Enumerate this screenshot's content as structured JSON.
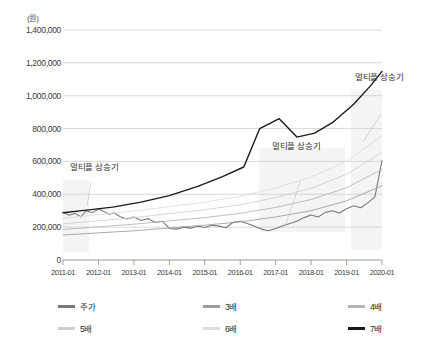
{
  "chart_data": {
    "type": "line",
    "title": "",
    "xlabel": "",
    "ylabel": "",
    "unit_label": "(원)",
    "ylim": [
      0,
      1400000
    ],
    "ytick_values": [
      1400000,
      1200000,
      1000000,
      800000,
      600000,
      400000,
      200000,
      0
    ],
    "ytick_labels": [
      "1,400,000",
      "1,200,000",
      "1,000,000",
      "800,000",
      "600,000",
      "400,000",
      "200,000",
      "0"
    ],
    "grid": true,
    "legend_position": "bottom",
    "categories": [
      "2011-01",
      "2012-01",
      "2013-01",
      "2014-01",
      "2015-01",
      "2016-01",
      "2017-01",
      "2018-01",
      "2019-01",
      "2020-01"
    ],
    "xtick_labels": [
      "2011-01",
      "2012-01",
      "2013-01",
      "2014-01",
      "2015-01",
      "2016-01",
      "2017-01",
      "2018-01",
      "2019-01",
      "2020-01"
    ],
    "series": [
      {
        "name": "주가",
        "color": "#7a7a7a",
        "width": 1.1,
        "x": [
          0,
          0.18,
          0.35,
          0.5,
          0.66,
          0.82,
          1,
          1.15,
          1.3,
          1.45,
          1.6,
          1.8,
          2,
          2.2,
          2.4,
          2.6,
          2.8,
          3,
          3.2,
          3.4,
          3.6,
          3.8,
          4,
          4.2,
          4.4,
          4.6,
          4.8,
          5,
          5.2,
          5.4,
          5.6,
          5.8,
          6,
          6.2,
          6.4,
          6.6,
          6.8,
          7,
          7.2,
          7.4,
          7.6,
          7.8,
          8,
          8.2,
          8.4,
          8.6,
          8.8,
          9
        ],
        "values": [
          290000,
          272000,
          284000,
          262000,
          300000,
          288000,
          310000,
          296000,
          278000,
          286000,
          265000,
          250000,
          262000,
          240000,
          252000,
          228000,
          236000,
          192000,
          188000,
          200000,
          194000,
          205000,
          198000,
          212000,
          206000,
          196000,
          230000,
          236000,
          222000,
          206000,
          188000,
          178000,
          192000,
          208000,
          222000,
          236000,
          258000,
          274000,
          262000,
          290000,
          300000,
          286000,
          312000,
          330000,
          318000,
          348000,
          384000,
          606000
        ]
      },
      {
        "name": "3배",
        "color": "#9c9c9c",
        "width": 0.85,
        "x": [
          0,
          2,
          4,
          5,
          6,
          7,
          8,
          9
        ],
        "values": [
          152000,
          178000,
          212000,
          232000,
          262000,
          300000,
          360000,
          452000
        ]
      },
      {
        "name": "4배",
        "color": "#b4b4b4",
        "width": 0.85,
        "x": [
          0,
          2,
          4,
          5,
          6,
          7,
          8,
          9
        ],
        "values": [
          186000,
          218000,
          258000,
          284000,
          320000,
          368000,
          440000,
          552000
        ]
      },
      {
        "name": "5배",
        "color": "#cfcfcf",
        "width": 0.85,
        "x": [
          0,
          2,
          4,
          5,
          6,
          7,
          8,
          9
        ],
        "values": [
          220000,
          258000,
          306000,
          336000,
          380000,
          436000,
          522000,
          654000
        ]
      },
      {
        "name": "6배",
        "color": "#dcdcdc",
        "width": 0.85,
        "x": [
          0,
          2,
          4,
          5,
          6,
          7,
          8,
          9
        ],
        "values": [
          254000,
          298000,
          352000,
          388000,
          438000,
          504000,
          602000,
          756000
        ]
      },
      {
        "name": "7배",
        "color": "#1a1a1a",
        "width": 1.4,
        "x": [
          0,
          0.6,
          1.4,
          2.2,
          3,
          3.8,
          4.5,
          5.1,
          5.55,
          6.1,
          6.6,
          7.1,
          7.6,
          8.2,
          8.7,
          9
        ],
        "values": [
          288000,
          302000,
          322000,
          352000,
          392000,
          448000,
          508000,
          566000,
          800000,
          860000,
          748000,
          772000,
          836000,
          948000,
          1066000,
          1148000
        ]
      }
    ],
    "annotations": [
      {
        "text": "멀티플 상승기"
      },
      {
        "text": "멀티플 상승기"
      },
      {
        "text": "멀티플 상승기"
      }
    ]
  },
  "legend": {
    "rows": [
      [
        {
          "label": "주가",
          "color": "#7a7a7a"
        },
        {
          "label": "3배",
          "color": "#9c9c9c"
        },
        {
          "label": "4배",
          "color": "#b4b4b4"
        }
      ],
      [
        {
          "label": "5배",
          "color": "#cfcfcf"
        },
        {
          "label": "6배",
          "color": "#dcdcdc"
        },
        {
          "label": "7배",
          "color": "#1a1a1a"
        }
      ]
    ]
  },
  "colors": {
    "grid": "#c8c8c8",
    "axis": "#8c8c8c",
    "text": "#333333",
    "highlight_band": "#f2f2f2"
  }
}
